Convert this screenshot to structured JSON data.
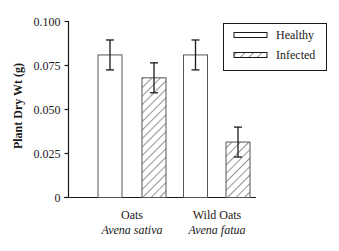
{
  "chart_data": {
    "type": "bar",
    "title": "",
    "xlabel": "",
    "ylabel": "Plant Dry Wt (g)",
    "ylim": [
      0,
      0.1
    ],
    "yticks": [
      "0",
      "0.025",
      "0.050",
      "0.075",
      "0.100"
    ],
    "ytick_values": [
      0,
      0.025,
      0.05,
      0.075,
      0.1
    ],
    "grid": false,
    "legend_position": "upper right",
    "categories": [
      {
        "name": "Oats",
        "species": "Avena sativa"
      },
      {
        "name": "Wild Oats",
        "species": "Avena fatua"
      }
    ],
    "series": [
      {
        "name": "Healthy",
        "pattern": "open",
        "values": [
          0.081,
          0.081
        ],
        "errors": [
          0.0085,
          0.0085
        ]
      },
      {
        "name": "Infected",
        "pattern": "hatched",
        "values": [
          0.068,
          0.0315
        ],
        "errors": [
          0.0085,
          0.0085
        ]
      }
    ]
  },
  "legend": {
    "items": [
      {
        "label": "Healthy",
        "pattern": "open"
      },
      {
        "label": "Infected",
        "pattern": "hatched"
      }
    ]
  },
  "colors": {
    "ink": "#1a1a1a",
    "bar_fill": "#ffffff",
    "background": "#ffffff"
  }
}
